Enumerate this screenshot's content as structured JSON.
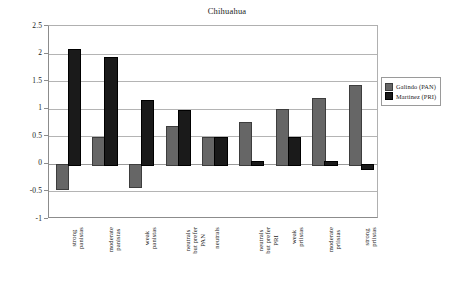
{
  "chart_data": {
    "type": "bar",
    "title": "Chihuahua",
    "xlabel": "",
    "ylabel": "",
    "ylim": [
      -1,
      2.5
    ],
    "yticks": [
      2.5,
      2,
      1.5,
      1,
      0.5,
      0,
      -0.5,
      -1
    ],
    "ytick_labels": [
      "2.5",
      "2",
      "1.5",
      "1",
      "0.5",
      "0",
      "-0.5",
      "-1"
    ],
    "grid": true,
    "legend_position": "right",
    "categories": [
      "strong panistas",
      "moderate panistas",
      "weak panistas",
      "neutrals but prefer PAN",
      "neutrals",
      "neutrals but prefer PRI",
      "weak priistas",
      "moderate priistas",
      "strong priistas"
    ],
    "category_lines": [
      [
        "strong",
        "panistas"
      ],
      [
        "moderate",
        "panistas"
      ],
      [
        "weak",
        "panistas"
      ],
      [
        "neutrals",
        "but prefer",
        "PAN"
      ],
      [
        "neutrals"
      ],
      [
        "neutrals",
        "but prefer",
        "PRI"
      ],
      [
        "weak",
        "priistas"
      ],
      [
        "moderate",
        "priistas"
      ],
      [
        "strong",
        "priistas"
      ]
    ],
    "series": [
      {
        "name": "Galindo (PAN)",
        "color": "#666666",
        "values": [
          -0.43,
          0.49,
          -0.41,
          0.69,
          0.49,
          0.76,
          0.99,
          1.2,
          1.43
        ]
      },
      {
        "name": "Martinez (PRI)",
        "color": "#1a1a1a",
        "values": [
          2.08,
          1.94,
          1.16,
          0.98,
          0.49,
          0.05,
          0.49,
          0.05,
          -0.08
        ]
      }
    ]
  },
  "legend": {
    "items": [
      {
        "label": "Galindo (PAN)",
        "swatch": "pan"
      },
      {
        "label": "Martinez (PRI)",
        "swatch": "pri"
      }
    ]
  }
}
